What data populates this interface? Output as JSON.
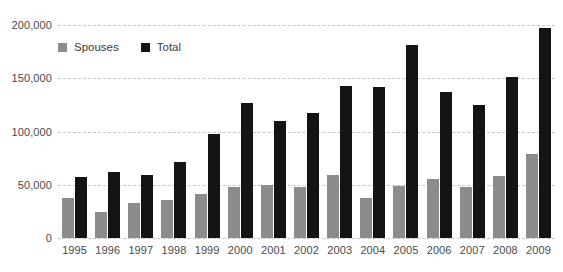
{
  "chart_data": {
    "type": "bar",
    "title": "",
    "xlabel": "",
    "ylabel": "",
    "ylim": [
      0,
      200000
    ],
    "yticks": [
      0,
      50000,
      100000,
      150000,
      200000
    ],
    "ytick_labels": [
      "0",
      "50,000",
      "100,000",
      "150,000",
      "200,000"
    ],
    "grid": true,
    "legend_position": "top-left",
    "categories": [
      "1995",
      "1996",
      "1997",
      "1998",
      "1999",
      "2000",
      "2001",
      "2002",
      "2003",
      "2004",
      "2005",
      "2006",
      "2007",
      "2008",
      "2009"
    ],
    "series": [
      {
        "name": "Spouses",
        "color": "#8c8c8c",
        "values": [
          37500,
          24000,
          33000,
          36000,
          41000,
          48000,
          50000,
          48000,
          59000,
          38000,
          49000,
          55000,
          48000,
          58000,
          79000
        ]
      },
      {
        "name": "Total",
        "color": "#141414",
        "values": [
          57000,
          62000,
          59000,
          71000,
          98000,
          127000,
          110000,
          117000,
          143000,
          142000,
          181000,
          137000,
          125000,
          151000,
          197000
        ]
      }
    ]
  },
  "legend": {
    "items": [
      {
        "label": "Spouses",
        "color": "#8c8c8c"
      },
      {
        "label": "Total",
        "color": "#141414"
      }
    ]
  },
  "title_remnant": "",
  "colors": {
    "background": "#ffffff",
    "gridline": "#c3c6cc",
    "axis_text": "#4a4a4a",
    "series_spouses": "#8c8c8c",
    "series_total": "#141414"
  }
}
